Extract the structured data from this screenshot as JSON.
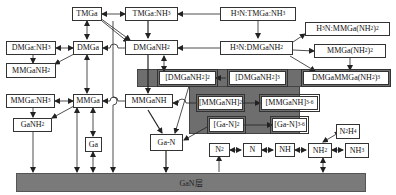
{
  "nodes": {
    "TMGa": "TMGa",
    "TMGaNH3": "TMGa:NH3",
    "H3NTMGaNH3": "H3N:TMGa:NH3",
    "DMGaNH3": "DMGa:NH3",
    "DMGa": "DMGa",
    "DMGaNH2": "DMGaNH2",
    "H3NDMGaNH2": "H3N:DMGaNH2",
    "H3NMMGaNH22": "H3N:MMGa(NH2)2",
    "MMGaNH22": "MMGa(NH2)2",
    "MMGaNH2": "MMGaNH2",
    "DMGaNH2_2": "[DMGaNH2]2",
    "DMGaNH2_3": "[DMGaNH2]3",
    "DMGaMMGaNH23": "DMGaMMGa(NH2)3",
    "MMGaNH3": "MMGa:NH3",
    "MMGa": "MMGa",
    "MMGaNH": "MMGaNH",
    "MMGaNH_2": "[MMGaNH]2",
    "MMGaNH_36": "[MMGaNH]3-6",
    "GaNH2": "GaNH2",
    "Ga": "Ga",
    "GaN": "Ga-N",
    "GaN_2": "[Ga-N]2",
    "GaN_36": "[Ga-N]3-6",
    "N2H4": "N2H4",
    "N2": "N2",
    "N": "N",
    "NH": "NH",
    "NH2": "NH2",
    "NH3": "NH3"
  },
  "base_layer": {
    "label": "GaN层"
  },
  "colors": {
    "group_fill": "#6e6e6e",
    "base_fill": "#7a7a7a",
    "line": "#222222"
  }
}
